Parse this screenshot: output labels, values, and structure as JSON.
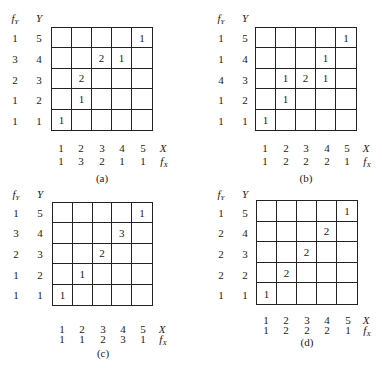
{
  "figure": {
    "panels": [
      {
        "id": "a",
        "caption": "(a)",
        "headers": {
          "fy": "f",
          "fy_sub": "Y",
          "y": "Y",
          "x": "X",
          "fx": "f",
          "fx_sub": "X"
        },
        "y_values": [
          "5",
          "4",
          "3",
          "2",
          "1"
        ],
        "fy_values": [
          "1",
          "3",
          "2",
          "1",
          "1"
        ],
        "x_values": [
          "1",
          "2",
          "3",
          "4",
          "5"
        ],
        "fx_values": [
          "1",
          "3",
          "2",
          "1",
          "1"
        ],
        "cells": [
          [
            "",
            "",
            "",
            "",
            "1"
          ],
          [
            "",
            "",
            "2",
            "1",
            ""
          ],
          [
            "",
            "2",
            "",
            "",
            ""
          ],
          [
            "",
            "1",
            "",
            "",
            ""
          ],
          [
            "1",
            "",
            "",
            "",
            ""
          ]
        ]
      },
      {
        "id": "b",
        "caption": "(b)",
        "headers": {
          "fy": "f",
          "fy_sub": "Y",
          "y": "Y",
          "x": "X",
          "fx": "f",
          "fx_sub": "X"
        },
        "y_values": [
          "5",
          "4",
          "3",
          "2",
          "1"
        ],
        "fy_values": [
          "1",
          "1",
          "4",
          "1",
          "1"
        ],
        "x_values": [
          "1",
          "2",
          "3",
          "4",
          "5"
        ],
        "fx_values": [
          "1",
          "2",
          "2",
          "2",
          "1"
        ],
        "cells": [
          [
            "",
            "",
            "",
            "",
            "1"
          ],
          [
            "",
            "",
            "",
            "1",
            ""
          ],
          [
            "",
            "1",
            "2",
            "1",
            ""
          ],
          [
            "",
            "1",
            "",
            "",
            ""
          ],
          [
            "1",
            "",
            "",
            "",
            ""
          ]
        ]
      },
      {
        "id": "c",
        "caption": "(c)",
        "headers": {
          "fy": "f",
          "fy_sub": "Y",
          "y": "Y",
          "x": "X",
          "fx": "f",
          "fx_sub": "X"
        },
        "y_values": [
          "5",
          "4",
          "3",
          "2",
          "1"
        ],
        "fy_values": [
          "1",
          "3",
          "2",
          "1",
          "1"
        ],
        "x_values": [
          "1",
          "2",
          "3",
          "4",
          "5"
        ],
        "fx_values": [
          "1",
          "1",
          "2",
          "3",
          "1"
        ],
        "cells": [
          [
            "",
            "",
            "",
            "",
            "1"
          ],
          [
            "",
            "",
            "",
            "3",
            ""
          ],
          [
            "",
            "",
            "2",
            "",
            ""
          ],
          [
            "",
            "1",
            "",
            "",
            ""
          ],
          [
            "1",
            "",
            "",
            "",
            ""
          ]
        ]
      },
      {
        "id": "d",
        "caption": "(d)",
        "headers": {
          "fy": "f",
          "fy_sub": "Y",
          "y": "Y",
          "x": "X",
          "fx": "f",
          "fx_sub": "X"
        },
        "y_values": [
          "5",
          "4",
          "3",
          "2",
          "1"
        ],
        "fy_values": [
          "1",
          "2",
          "2",
          "2",
          "1"
        ],
        "x_values": [
          "1",
          "2",
          "3",
          "4",
          "5"
        ],
        "fx_values": [
          "1",
          "2",
          "2",
          "2",
          "1"
        ],
        "cells": [
          [
            "",
            "",
            "",
            "",
            "1"
          ],
          [
            "",
            "",
            "",
            "2",
            ""
          ],
          [
            "",
            "",
            "2",
            "",
            ""
          ],
          [
            "",
            "2",
            "",
            "",
            ""
          ],
          [
            "1",
            "",
            "",
            "",
            ""
          ]
        ]
      }
    ]
  }
}
